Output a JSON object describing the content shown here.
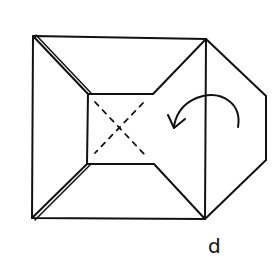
{
  "diagram": {
    "type": "origami-fold-step",
    "step_label": "d",
    "stroke_color": "#111111",
    "background": "#ffffff",
    "elements": [
      {
        "name": "outer-square",
        "description": "outer square outline"
      },
      {
        "name": "inner-square",
        "description": "center square with dashed X (valley folds)"
      },
      {
        "name": "right-flap",
        "description": "hexagonal flap extending to the right"
      },
      {
        "name": "turn-arrow",
        "description": "curved arrow indicating fold over to the left"
      }
    ]
  }
}
